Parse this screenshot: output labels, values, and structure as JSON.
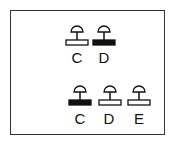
{
  "diagram": {
    "rows": [
      {
        "items": [
          {
            "label": "C",
            "bar": "open",
            "cx": 77,
            "top": 21
          },
          {
            "label": "D",
            "bar": "filled",
            "cx": 104,
            "top": 21
          }
        ],
        "label_top": 50
      },
      {
        "items": [
          {
            "label": "C",
            "bar": "filled",
            "cx": 80,
            "top": 81
          },
          {
            "label": "D",
            "bar": "open",
            "cx": 107,
            "top": 81
          },
          {
            "label": "E",
            "bar": "open",
            "cx": 137,
            "top": 81
          }
        ],
        "label_top": 111
      }
    ],
    "colors": {
      "stroke": "#111111",
      "filled": "#111111",
      "open": "#ffffff",
      "frame": "#333333"
    }
  }
}
